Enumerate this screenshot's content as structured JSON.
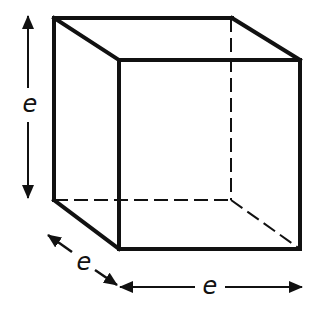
{
  "diagram": {
    "type": "cube",
    "colors": {
      "stroke": "#111111",
      "background": "#ffffff"
    },
    "labels": {
      "height": "e",
      "depth": "e",
      "width": "e"
    }
  }
}
